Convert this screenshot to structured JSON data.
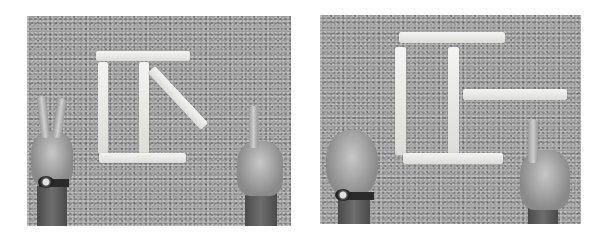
{
  "figure": {
    "panels": [
      {
        "id": "left",
        "arrangement": "Sticks forming a 'pi / T' shape with a diagonal stick on the right",
        "left_hand_gesture": "two fingers (V sign)",
        "right_hand_gesture": "one finger pointing",
        "stick_count": 5
      },
      {
        "id": "right",
        "arrangement": "Sticks forming a rectangle with middle vertical and a horizontal stick extending right",
        "left_hand_gesture": "fist",
        "right_hand_gesture": "one finger pointing",
        "stick_count": 5
      }
    ],
    "colors": {
      "background": "#ffffff",
      "gravel": "#9a9a9a",
      "stick": "#ececea",
      "arm": "#5a5a5a"
    }
  }
}
